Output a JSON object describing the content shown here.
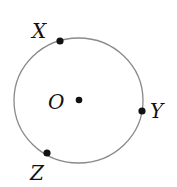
{
  "diagram": {
    "type": "circle-with-points",
    "circle": {
      "center_label": "O",
      "stroke_color": "#8a8a8a"
    },
    "points": [
      {
        "id": "X",
        "label": "X",
        "on_circle": true
      },
      {
        "id": "Y",
        "label": "Y",
        "on_circle": true
      },
      {
        "id": "Z",
        "label": "Z",
        "on_circle": true
      },
      {
        "id": "O",
        "label": "O",
        "on_circle": false,
        "role": "center"
      }
    ],
    "labels": {
      "x": "X",
      "y": "Y",
      "z": "Z",
      "o": "O"
    },
    "point_color": "#111111"
  }
}
